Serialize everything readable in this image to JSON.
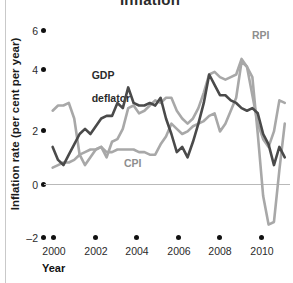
{
  "chart_data": {
    "type": "line",
    "title": "Inflation",
    "xlabel": "Year",
    "ylabel": "Inflation rate (per cent per year)",
    "xlim": [
      1999.6,
      2010.9
    ],
    "ylim": [
      -2,
      6
    ],
    "yticks": [
      6,
      4,
      2,
      0,
      -2
    ],
    "ytick_labels": [
      "6",
      "4",
      "2",
      "0",
      "–2"
    ],
    "xticks": [
      2000,
      2002,
      2004,
      2006,
      2008,
      2010
    ],
    "xtick_labels": [
      "2000",
      "2002",
      "2004",
      "2006",
      "2008",
      "2010"
    ],
    "grid": false,
    "zero_line": true,
    "legend_position": "inline-annotations",
    "annotations": [
      {
        "text": "GDP\ndeflator",
        "series": "GDP deflator",
        "color": "#2b2b2b"
      },
      {
        "text": "CPI",
        "series": "CPI",
        "color": "#8e8e8e"
      },
      {
        "text": "RPI",
        "series": "RPI",
        "color": "#8e8e8e"
      }
    ],
    "colors": {
      "rpi": "#a8a8a8",
      "cpi": "#a8a8a8",
      "gdp_deflator": "#4a4a4a",
      "zero_line": "#b9b9b9",
      "tick_dot": "#111111"
    },
    "x": [
      2000.0,
      2000.25,
      2000.5,
      2000.75,
      2001.0,
      2001.25,
      2001.5,
      2001.75,
      2002.0,
      2002.25,
      2002.5,
      2002.75,
      2003.0,
      2003.25,
      2003.5,
      2003.75,
      2004.0,
      2004.25,
      2004.5,
      2004.75,
      2005.0,
      2005.25,
      2005.5,
      2005.75,
      2006.0,
      2006.25,
      2006.5,
      2006.75,
      2007.0,
      2007.25,
      2007.5,
      2007.75,
      2008.0,
      2008.25,
      2008.5,
      2008.75,
      2009.0,
      2009.25,
      2009.5,
      2009.75,
      2010.0,
      2010.25,
      2010.5,
      2010.75
    ],
    "series": [
      {
        "name": "RPI",
        "color": "#a8a8a8",
        "values": [
          2.9,
          3.1,
          3.1,
          3.2,
          2.6,
          1.2,
          0.8,
          1.1,
          1.4,
          1.5,
          1.1,
          1.7,
          1.8,
          2.2,
          3.0,
          3.1,
          2.8,
          2.9,
          3.1,
          3.3,
          3.2,
          3.4,
          3.4,
          2.9,
          2.6,
          2.4,
          2.6,
          3.0,
          3.6,
          4.3,
          4.4,
          4.2,
          4.1,
          4.2,
          4.3,
          4.9,
          4.6,
          4.2,
          2.0,
          -0.4,
          -1.5,
          -1.4,
          0.6,
          2.4
        ]
      },
      {
        "name": "CPI",
        "color": "#a8a8a8",
        "values": [
          0.7,
          0.8,
          0.9,
          0.9,
          1.0,
          1.2,
          1.3,
          1.4,
          1.4,
          1.5,
          1.3,
          1.3,
          1.4,
          1.4,
          1.4,
          1.4,
          1.3,
          1.3,
          1.2,
          1.2,
          1.6,
          1.9,
          2.4,
          2.2,
          2.0,
          2.1,
          2.3,
          2.4,
          2.5,
          2.7,
          2.8,
          2.1,
          2.4,
          2.9,
          3.4,
          4.8,
          4.6,
          3.5,
          2.4,
          1.8,
          1.5,
          2.1,
          3.3,
          3.2
        ]
      },
      {
        "name": "GDP deflator",
        "color": "#4a4a4a",
        "values": [
          1.5,
          1.0,
          0.8,
          1.2,
          1.6,
          2.0,
          2.2,
          2.0,
          2.3,
          2.6,
          2.7,
          2.7,
          3.2,
          3.0,
          3.8,
          3.2,
          3.1,
          3.1,
          3.2,
          3.1,
          3.4,
          2.6,
          2.0,
          1.3,
          1.5,
          1.1,
          1.7,
          2.4,
          3.2,
          4.3,
          3.9,
          3.5,
          3.5,
          3.3,
          3.2,
          3.0,
          2.9,
          3.0,
          2.8,
          2.0,
          1.6,
          0.8,
          1.5,
          1.1
        ]
      }
    ],
    "series_note": "Quarterly inflation rates, per cent per year, 2000–2010"
  },
  "axes": {
    "y_title": "Inflation rate (per cent per year)",
    "x_title": "Year"
  },
  "labels": {
    "gdp_line1": "GDP",
    "gdp_line2": "deflator",
    "cpi": "CPI",
    "rpi": "RPI",
    "title": "Inflation"
  }
}
